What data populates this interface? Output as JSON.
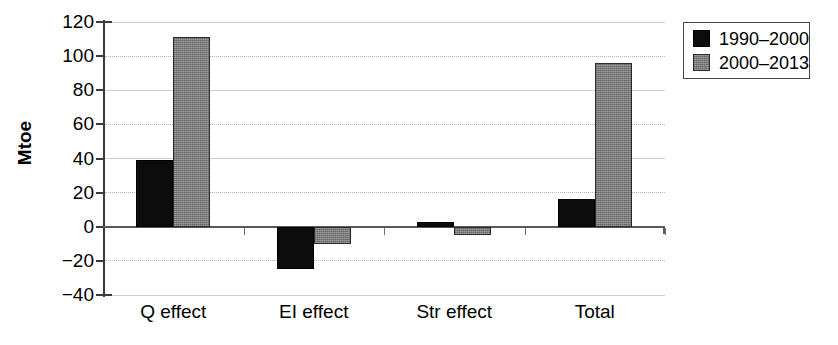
{
  "chart_data": {
    "type": "bar",
    "title": "",
    "xlabel": "",
    "ylabel": "Mtoe",
    "ylim": [
      -40,
      120
    ],
    "yticks": [
      -40,
      -20,
      0,
      20,
      40,
      60,
      80,
      100,
      120
    ],
    "ytick_labels": [
      "−40",
      "−20",
      "0",
      "20",
      "40",
      "60",
      "80",
      "100",
      "120"
    ],
    "grid": true,
    "legend_position": "upper right",
    "categories": [
      "Q effect",
      "EI effect",
      "Str effect",
      "Total"
    ],
    "series": [
      {
        "name": "1990–2000",
        "color": "#0c0c0c",
        "values": [
          39,
          -25,
          3,
          16
        ]
      },
      {
        "name": "2000–2013",
        "color": "#7c7c7c",
        "values": [
          111,
          -10,
          -5,
          96
        ]
      }
    ]
  },
  "legend": {
    "items": [
      {
        "label": "1990–2000",
        "swatch": "black-swatch-icon"
      },
      {
        "label": "2000–2013",
        "swatch": "gray-swatch-icon"
      }
    ]
  }
}
